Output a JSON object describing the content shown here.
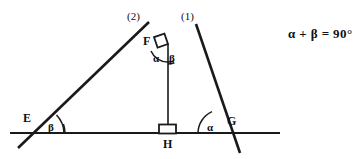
{
  "figure": {
    "stroke_color": "#1a1a1a",
    "background_color": "#ffffff",
    "points": {
      "E": {
        "label": "E",
        "x": 37,
        "y": 131
      },
      "F": {
        "label": "F",
        "x": 168,
        "y": 44
      },
      "G": {
        "label": "G",
        "x": 222,
        "y": 131
      },
      "H": {
        "label": "H",
        "x": 168,
        "y": 133
      }
    },
    "rays": {
      "ray_one": {
        "label": "(1)",
        "x": 186,
        "y": 13
      },
      "ray_two": {
        "label": "(2)",
        "x": 132,
        "y": 13
      }
    },
    "angles": {
      "at_F_left": {
        "label": "α",
        "x": 157,
        "y": 58
      },
      "at_F_right": {
        "label": "β",
        "x": 172,
        "y": 58
      },
      "at_E": {
        "label": "β",
        "x": 50,
        "y": 124
      },
      "at_G": {
        "label": "α",
        "x": 208,
        "y": 124
      }
    },
    "right_angle_markers": [
      {
        "name": "right-angle-at-F",
        "x": 168,
        "y": 44
      },
      {
        "name": "right-angle-at-H",
        "x": 168,
        "y": 133
      }
    ],
    "point_labels": {
      "E": {
        "text": "E",
        "x": 25,
        "y": 114
      },
      "F": {
        "text": "F",
        "x": 145,
        "y": 37
      },
      "G": {
        "text": "G",
        "x": 226,
        "y": 116
      },
      "H": {
        "text": "H",
        "x": 164,
        "y": 139
      }
    }
  },
  "annotation": {
    "equation": "α + β  =  90°",
    "x": 288,
    "y": 28
  }
}
